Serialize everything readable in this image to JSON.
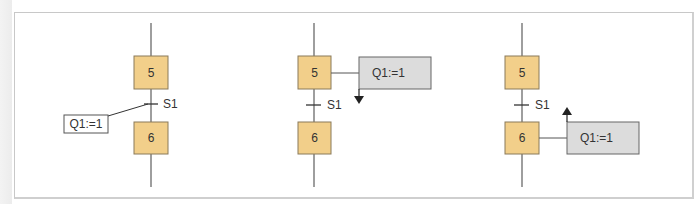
{
  "diagram": {
    "type": "SFC / GRAFCET action association variants",
    "colors": {
      "step_fill": "#f2cf8a",
      "step_stroke": "#8a7a5a",
      "line": "#6a6a6a",
      "action_fill_plain": "#ffffff",
      "action_fill_grey": "#dcdcdc",
      "frame_border": "#c8c8c8"
    },
    "panels": [
      {
        "id": "panel-1",
        "variant": "action on transition",
        "steps": [
          {
            "label": "5"
          },
          {
            "label": "6"
          }
        ],
        "transition": {
          "label": "S1"
        },
        "action": {
          "label": "Q1:=1"
        }
      },
      {
        "id": "panel-2",
        "variant": "action on step deactivation (arrow down)",
        "steps": [
          {
            "label": "5"
          },
          {
            "label": "6"
          }
        ],
        "transition": {
          "label": "S1"
        },
        "action": {
          "label": "Q1:=1"
        }
      },
      {
        "id": "panel-3",
        "variant": "action on step activation (arrow up)",
        "steps": [
          {
            "label": "5"
          },
          {
            "label": "6"
          }
        ],
        "transition": {
          "label": "S1"
        },
        "action": {
          "label": "Q1:=1"
        }
      }
    ]
  }
}
